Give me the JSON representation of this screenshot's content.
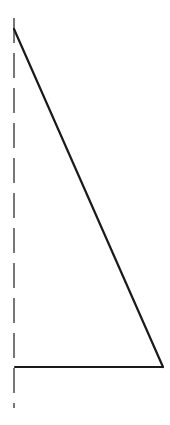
{
  "diagram": {
    "type": "right-triangle-with-dashed-axis",
    "width": 170,
    "height": 425,
    "colors": {
      "background": "#ffffff",
      "stroke": "#1a1a1a",
      "dash": "#555555"
    },
    "dashed_axis": {
      "x": 14,
      "y1": 18,
      "y2": 408,
      "dasharray": "25 10"
    },
    "triangle": {
      "top_vertex": [
        14,
        29
      ],
      "bottom_left_vertex": [
        15,
        367
      ],
      "bottom_right_vertex": [
        163,
        367
      ]
    }
  }
}
